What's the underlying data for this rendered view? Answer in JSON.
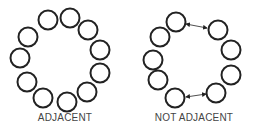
{
  "figures": [
    {
      "label": "ADJACENT",
      "circles": [
        [
          48,
          20
        ],
        [
          70,
          18
        ],
        [
          88,
          30
        ],
        [
          100,
          50
        ],
        [
          100,
          73
        ],
        [
          87,
          92
        ],
        [
          67,
          102
        ],
        [
          43,
          98
        ],
        [
          27,
          82
        ],
        [
          20,
          58
        ],
        [
          28,
          37
        ]
      ],
      "arrows": []
    },
    {
      "label": "NOT ADJACENT",
      "circles": [
        [
          176,
          22
        ],
        [
          218,
          30
        ],
        [
          231,
          50
        ],
        [
          231,
          75
        ],
        [
          216,
          93
        ],
        [
          175,
          98
        ],
        [
          158,
          80
        ],
        [
          153,
          60
        ],
        [
          160,
          37
        ]
      ],
      "arrows": [
        [
          [
            186,
            24
          ],
          [
            207,
            28
          ]
        ],
        [
          [
            186,
            97
          ],
          [
            206,
            94
          ]
        ]
      ]
    }
  ],
  "style": {
    "stroke": "#222222",
    "radius": 9.5,
    "stroke_width": 2
  }
}
